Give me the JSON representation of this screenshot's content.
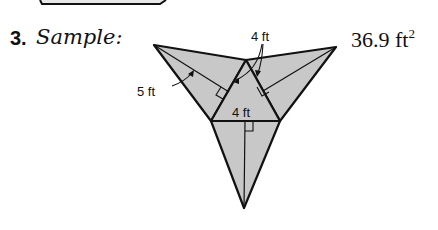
{
  "problem": {
    "number": "3.",
    "label": "Sample:",
    "answer_value": "36.9 ft",
    "answer_exponent": "2"
  },
  "figure": {
    "type": "net-of-triangular-pyramid",
    "fill_color": "#c8c8c8",
    "stroke_color": "#111111",
    "labels": {
      "slant_height": "5 ft",
      "side_top": "4 ft",
      "base_edge": "4 ft"
    }
  }
}
